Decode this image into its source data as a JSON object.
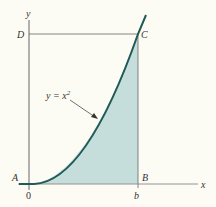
{
  "figure": {
    "curve_label": "y = x",
    "curve_exponent": "2",
    "points": {
      "A": "A",
      "B": "B",
      "C": "C",
      "D": "D"
    },
    "axes": {
      "x_label": "x",
      "y_label": "y",
      "origin_label": "0",
      "b_label": "b"
    },
    "colors": {
      "curve": "#1f5a56",
      "fill": "#c6dedb",
      "axis": "#555555",
      "background": "#fdfcf4"
    }
  }
}
